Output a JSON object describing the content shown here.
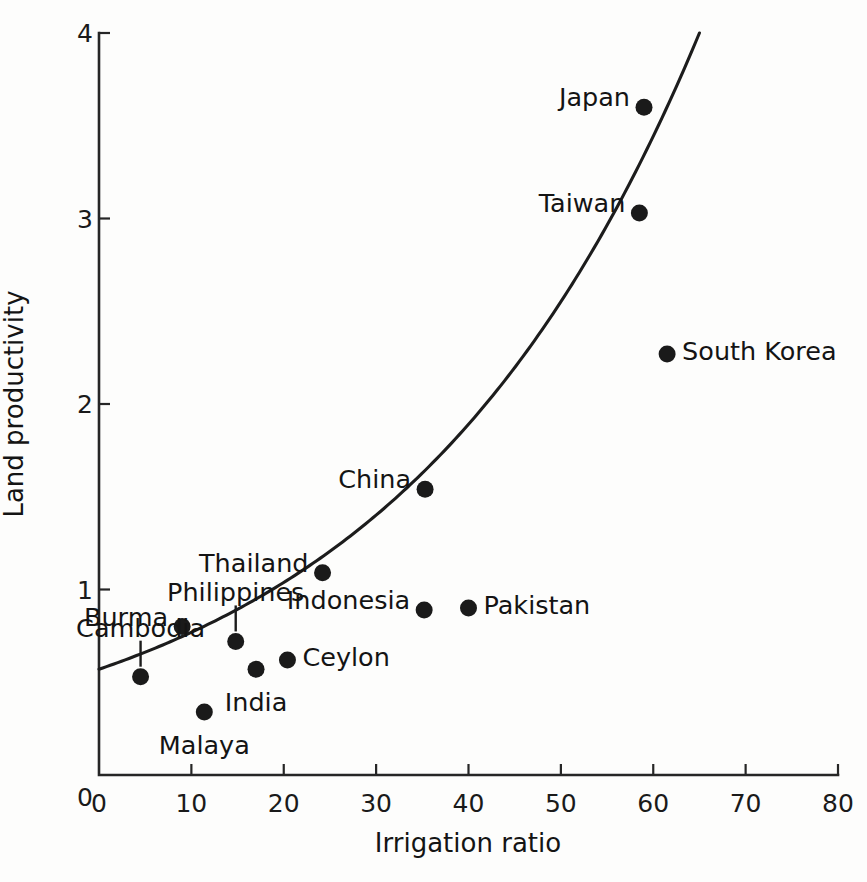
{
  "chart_data": {
    "type": "scatter",
    "title": "",
    "xlabel": "Irrigation  ratio",
    "ylabel": "Land productivity",
    "xlim": [
      0,
      80
    ],
    "ylim": [
      0,
      4
    ],
    "grid": false,
    "legend": "none",
    "xticks": [
      "0",
      "10",
      "20",
      "30",
      "40",
      "50",
      "60",
      "70",
      "80"
    ],
    "xtick_values": [
      0,
      10,
      20,
      30,
      40,
      50,
      60,
      70,
      80
    ],
    "yticks": [
      "0",
      "1",
      "2",
      "3",
      "4"
    ],
    "ytick_values": [
      0,
      1,
      2,
      3,
      4
    ],
    "points": [
      {
        "label": "Japan",
        "x": 59.0,
        "y": 3.6,
        "label_pos": "left",
        "leader": false
      },
      {
        "label": "Taiwan",
        "x": 58.5,
        "y": 3.03,
        "label_pos": "left",
        "leader": false
      },
      {
        "label": "South Korea",
        "x": 61.5,
        "y": 2.27,
        "label_pos": "right",
        "leader": false
      },
      {
        "label": "China",
        "x": 35.3,
        "y": 1.54,
        "label_pos": "left",
        "leader": false
      },
      {
        "label": "Thailand",
        "x": 24.2,
        "y": 1.09,
        "label_pos": "left",
        "leader": false
      },
      {
        "label": "Pakistan",
        "x": 40.0,
        "y": 0.9,
        "label_pos": "right",
        "leader": false
      },
      {
        "label": "Indonesia",
        "x": 35.2,
        "y": 0.89,
        "label_pos": "left",
        "leader": false
      },
      {
        "label": "Burma",
        "x": 9.0,
        "y": 0.8,
        "label_pos": "left",
        "leader": false
      },
      {
        "label": "Philippines",
        "x": 14.8,
        "y": 0.72,
        "label_pos": "above",
        "leader": true
      },
      {
        "label": "Ceylon",
        "x": 20.4,
        "y": 0.62,
        "label_pos": "right",
        "leader": false
      },
      {
        "label": "India",
        "x": 17.0,
        "y": 0.57,
        "label_pos": "below",
        "leader": false
      },
      {
        "label": "Cambodia",
        "x": 4.5,
        "y": 0.53,
        "label_pos": "above",
        "leader": true
      },
      {
        "label": "Malaya",
        "x": 11.4,
        "y": 0.34,
        "label_pos": "below",
        "leader": false
      }
    ],
    "fit_curve": {
      "name": "exponential-trend",
      "x_start": 0,
      "x_end": 65,
      "y_start": 0.57,
      "y_end": 4.0,
      "description": "smooth rising exponential trend line"
    }
  },
  "annotations": {
    "axis_color": "#262626",
    "marker_color": "#1a1a1a",
    "curve_color": "#1c1c1c",
    "background_color": "#fdfdfc"
  }
}
